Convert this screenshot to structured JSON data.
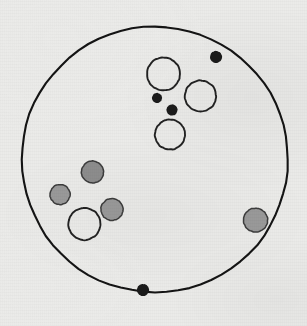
{
  "figure": {
    "title": "Scanned circular field diagram",
    "canvas": {
      "width": 307,
      "height": 326
    },
    "background_color": "#ebebe9",
    "ink_color": "#1a1a1a"
  },
  "boundary": {
    "name": "large-boundary-circle",
    "cx": 155,
    "cy": 159.5,
    "r": 133,
    "stroke": "#141414",
    "stroke_width": 2.1,
    "fill": "none"
  },
  "legend_colors": {
    "open_stroke": "#222222",
    "gray_fill": "#9a9a9a",
    "gray_fill_dark": "#8d8d8d",
    "gray_stroke": "#3c3c3c",
    "black_fill": "#1b1b1b"
  },
  "objects": [
    {
      "id": "open-circle-top-left",
      "kind": "open-circle",
      "cx": 163.5,
      "cy": 74,
      "r": 16.5,
      "fill": "none",
      "stroke": "#222222",
      "stroke_width": 1.9
    },
    {
      "id": "open-circle-top-right",
      "kind": "open-circle",
      "cx": 200.5,
      "cy": 96,
      "r": 15.5,
      "fill": "none",
      "stroke": "#222222",
      "stroke_width": 1.9
    },
    {
      "id": "open-circle-middle",
      "kind": "open-circle",
      "cx": 170,
      "cy": 134.5,
      "r": 15,
      "fill": "none",
      "stroke": "#222222",
      "stroke_width": 1.9
    },
    {
      "id": "open-circle-lower-left",
      "kind": "open-circle",
      "cx": 84.5,
      "cy": 224,
      "r": 16,
      "fill": "none",
      "stroke": "#222222",
      "stroke_width": 1.9
    },
    {
      "id": "gray-circle-upper-left-cluster",
      "kind": "gray-circle",
      "cx": 92.5,
      "cy": 172,
      "r": 11,
      "fill": "#8d8d8d",
      "stroke": "#3c3c3c",
      "stroke_width": 1.5
    },
    {
      "id": "gray-circle-left",
      "kind": "gray-circle",
      "cx": 60,
      "cy": 194.5,
      "r": 10,
      "fill": "#9a9a9a",
      "stroke": "#3c3c3c",
      "stroke_width": 1.5
    },
    {
      "id": "gray-circle-center-left",
      "kind": "gray-circle",
      "cx": 112,
      "cy": 209.5,
      "r": 11,
      "fill": "#9a9a9a",
      "stroke": "#3c3c3c",
      "stroke_width": 1.5
    },
    {
      "id": "gray-circle-right-edge",
      "kind": "gray-circle",
      "cx": 255.5,
      "cy": 220,
      "r": 12,
      "fill": "#9a9a9a",
      "stroke": "#3c3c3c",
      "stroke_width": 1.5
    },
    {
      "id": "black-dot-top-right",
      "kind": "black-dot",
      "cx": 216,
      "cy": 57,
      "r": 6,
      "fill": "#1b1b1b",
      "stroke": "none",
      "stroke_width": 0
    },
    {
      "id": "black-dot-center-upper",
      "kind": "black-dot",
      "cx": 157,
      "cy": 98,
      "r": 5,
      "fill": "#1b1b1b",
      "stroke": "none",
      "stroke_width": 0
    },
    {
      "id": "black-dot-center-lower",
      "kind": "black-dot",
      "cx": 172,
      "cy": 110,
      "r": 5.5,
      "fill": "#1b1b1b",
      "stroke": "none",
      "stroke_width": 0
    },
    {
      "id": "black-dot-bottom",
      "kind": "black-dot",
      "cx": 143,
      "cy": 290,
      "r": 6,
      "fill": "#1b1b1b",
      "stroke": "none",
      "stroke_width": 0
    }
  ],
  "counts": {
    "open_circles": 4,
    "gray_circles": 4,
    "black_dots": 4,
    "total_objects": 12
  }
}
